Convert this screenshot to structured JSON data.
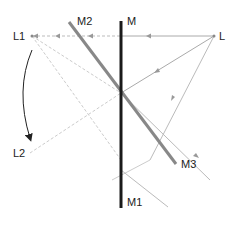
{
  "labels": {
    "L": "L",
    "L1": "L1",
    "L2": "L2",
    "M": "M",
    "M1": "M1",
    "M2": "M2",
    "M3": "M3"
  },
  "colors": {
    "mirror_main": "#1a1a1a",
    "mirror_rotated": "#888888",
    "ray": "#aaaaaa",
    "virtual_ray": "#c8c8c8",
    "arrow": "#222222"
  }
}
